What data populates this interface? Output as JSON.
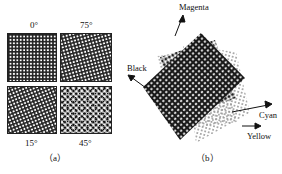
{
  "figure_a": {
    "caption": "（a）",
    "panels": [
      {
        "label": "0°",
        "angle": 0,
        "position": "top-left"
      },
      {
        "label": "75°",
        "angle": 75,
        "position": "top-right"
      },
      {
        "label": "15°",
        "angle": 15,
        "position": "bottom-left"
      },
      {
        "label": "45°",
        "angle": 45,
        "position": "bottom-right"
      }
    ]
  },
  "figure_b": {
    "caption": "（b）",
    "screens": [
      {
        "name": "Magenta",
        "direction": "up"
      },
      {
        "name": "Black",
        "direction": "up-left"
      },
      {
        "name": "Cyan",
        "direction": "right-up"
      },
      {
        "name": "Yellow",
        "direction": "right"
      }
    ]
  },
  "colors": {
    "ink": "#111111",
    "background": "#ffffff",
    "light_dot": "#9a9a9a"
  }
}
